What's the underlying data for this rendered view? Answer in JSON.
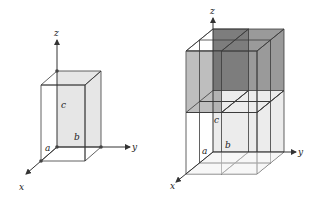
{
  "figure_left": {
    "title": "Unit cell",
    "axes": {
      "x": "x",
      "y": "y",
      "z": "z"
    },
    "edge_labels": {
      "a": "a",
      "b": "b",
      "c": "c"
    }
  },
  "figure_right": {
    "title": "2x2x2 block of unit cells",
    "axes": {
      "x": "x",
      "y": "y",
      "z": "z"
    },
    "edge_labels": {
      "a": "a",
      "b": "b",
      "c": "c"
    }
  },
  "colors": {
    "face_light": "#e3e3e3",
    "face_mid": "#c9c9c9",
    "face_dark": "#8c8c8c",
    "edge": "#3a3a3a"
  }
}
